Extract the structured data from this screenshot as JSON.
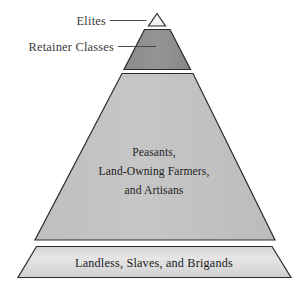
{
  "figure": {
    "background_color": "#ffffff"
  },
  "callouts": [
    {
      "label": "Elites",
      "target": "apex-triangle"
    },
    {
      "label": "Retainer Classes",
      "target": "retainer-trapezoid"
    }
  ],
  "tiers": [
    {
      "id": "elites",
      "label": "Elites",
      "shape": "triangle",
      "fill": "#f2f2f2",
      "stroke": "#2b2b2b",
      "label_position": "callout-left"
    },
    {
      "id": "retainers",
      "label": "Retainer Classes",
      "shape": "trapezoid",
      "fill": "#8e8e8e",
      "stroke": "#2b2b2b",
      "label_position": "callout-left"
    },
    {
      "id": "peasants",
      "label_lines": [
        "Peasants,",
        "Land-Owning Farmers,",
        "and Artisans"
      ],
      "shape": "trapezoid",
      "fill": "#c3c3c3",
      "stroke": "#2b2b2b",
      "label_position": "inside"
    },
    {
      "id": "landless",
      "label": "Landless, Slaves, and Brigands",
      "shape": "trapezoid-base",
      "fill": "#dcdcdc",
      "stroke": "#2b2b2b",
      "label_position": "inside"
    }
  ],
  "colors": {
    "apex_fill": "#f2f2f2",
    "retainer_fill": "#8e8e8e",
    "peasant_fill": "#c3c3c3",
    "base_fill": "#dcdcdc",
    "outline": "#2b2b2b",
    "label_text": "#3a3a3a",
    "tier_text": "#1e1e1e"
  }
}
